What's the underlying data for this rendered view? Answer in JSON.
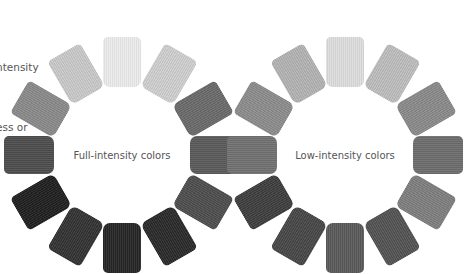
{
  "caption": {
    "lines": [
      "ntensity",
      "ess or"
    ]
  },
  "wheels": [
    {
      "id": "full",
      "label": "Full-intensity colors",
      "center": [
        122,
        155
      ],
      "radius": 93,
      "swatches": [
        "#ececec",
        "#cfcfcf",
        "#6a6a6a",
        "#5a5a5a",
        "#4e4e4e",
        "#2a2a2a",
        "#262626",
        "#333333",
        "#202020",
        "#4d4d4d",
        "#8a8a8a",
        "#c9c9c9"
      ]
    },
    {
      "id": "low",
      "label": "Low-intensity colors",
      "center": [
        345,
        155
      ],
      "radius": 93,
      "swatches": [
        "#dedede",
        "#bdbdbd",
        "#8a8a8a",
        "#6d6d6d",
        "#7e7e7e",
        "#535353",
        "#5a5a5a",
        "#474747",
        "#3e3e3e",
        "#717171",
        "#8c8c8c",
        "#b3b3b3"
      ]
    }
  ]
}
